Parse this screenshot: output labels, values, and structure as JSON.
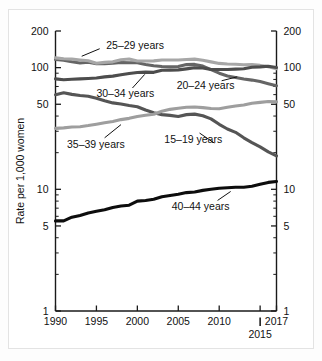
{
  "chart_data": {
    "type": "line",
    "title": "",
    "xlabel": "",
    "ylabel": "Rate per 1,000 women",
    "yscale": "log",
    "ylim": [
      1,
      200
    ],
    "xlim": [
      1990,
      2017
    ],
    "grid": false,
    "legend_position": "inline-labels",
    "y_ticks_major": [
      1,
      5,
      10,
      50,
      100,
      200
    ],
    "y_tick_labels": [
      "1",
      "5",
      "10",
      "50",
      "100",
      "200"
    ],
    "y_ticks_minor": [
      2,
      3,
      4,
      6,
      7,
      8,
      9,
      20,
      30,
      40,
      60,
      70,
      80,
      90
    ],
    "x_ticks": [
      1990,
      1995,
      2000,
      2005,
      2010,
      2017
    ],
    "x_tick_labels": [
      "1990",
      "1995",
      "2000",
      "2005",
      "2010",
      "2017"
    ],
    "x_tick_extra": {
      "value": 2015,
      "label": "2015"
    },
    "x": [
      1990,
      1991,
      1992,
      1993,
      1994,
      1995,
      1996,
      1997,
      1998,
      1999,
      2000,
      2001,
      2002,
      2003,
      2004,
      2005,
      2006,
      2007,
      2008,
      2009,
      2010,
      2011,
      2012,
      2013,
      2014,
      2015,
      2016,
      2017
    ],
    "series": [
      {
        "name": "15–19 years",
        "color": "#555555",
        "label_x": 2003.3,
        "label_y": 26.0,
        "leader": [
          [
            2007.6,
            29.0
          ],
          [
            2009.4,
            24.0
          ]
        ],
        "values": [
          59.9,
          62.1,
          60.3,
          59.0,
          58.2,
          56.0,
          53.5,
          51.3,
          50.3,
          48.8,
          47.7,
          44.8,
          42.6,
          41.1,
          40.5,
          39.7,
          41.1,
          41.5,
          40.2,
          37.9,
          34.2,
          31.3,
          29.4,
          26.5,
          24.2,
          22.3,
          20.3,
          18.8
        ]
      },
      {
        "name": "20–24 years",
        "color": "#656565",
        "label_x": 2004.8,
        "label_y": 72.0,
        "leader": [
          [
            2010.3,
            78.0
          ],
          [
            2012.2,
            84.0
          ]
        ],
        "values": [
          116.5,
          115.3,
          111.6,
          109.2,
          110.6,
          107.5,
          107.8,
          108.9,
          110.2,
          109.7,
          109.7,
          106.2,
          103.6,
          102.1,
          101.7,
          102.2,
          105.9,
          106.3,
          103.0,
          96.3,
          90.0,
          85.3,
          83.1,
          80.7,
          79.0,
          76.8,
          73.8,
          71.0
        ]
      },
      {
        "name": "25–29 years",
        "color": "#a7a7a7",
        "label_x": 1996.2,
        "label_y": 152.0,
        "leader": [
          [
            1995.4,
            143.0
          ],
          [
            1993.2,
            124.0
          ]
        ],
        "values": [
          120.2,
          118.2,
          117.4,
          115.5,
          113.9,
          108.8,
          110.4,
          111.6,
          115.9,
          117.8,
          113.5,
          113.4,
          113.6,
          115.6,
          115.5,
          115.5,
          116.7,
          117.5,
          115.1,
          111.5,
          108.3,
          107.2,
          106.5,
          105.5,
          105.8,
          104.3,
          101.9,
          98.0
        ]
      },
      {
        "name": "30–34 years",
        "color": "#4d4d4d",
        "label_x": 1995.0,
        "label_y": 62.0,
        "leader": [
          [
            1999.4,
            68.0
          ],
          [
            2000.9,
            88.0
          ]
        ],
        "values": [
          80.8,
          79.5,
          80.2,
          80.8,
          81.5,
          82.1,
          83.9,
          85.2,
          87.4,
          89.6,
          91.2,
          91.9,
          91.5,
          95.1,
          95.3,
          95.8,
          97.7,
          99.9,
          99.3,
          96.5,
          96.5,
          96.5,
          97.3,
          98.0,
          100.8,
          101.5,
          102.6,
          100.3
        ]
      },
      {
        "name": "35–39 years",
        "color": "#9e9e9e",
        "label_x": 1991.4,
        "label_y": 23.5,
        "leader": [
          [
            1996.0,
            26.5
          ],
          [
            1998.0,
            34.0
          ]
        ],
        "values": [
          31.7,
          32.0,
          32.5,
          32.7,
          33.4,
          34.3,
          35.3,
          36.1,
          37.4,
          38.3,
          39.7,
          40.6,
          41.4,
          43.8,
          45.4,
          46.3,
          47.3,
          47.5,
          46.9,
          46.1,
          45.9,
          47.2,
          48.3,
          49.3,
          51.0,
          51.8,
          52.7,
          52.3
        ]
      },
      {
        "name": "40–44 years",
        "color": "#0d0d0d",
        "label_x": 2004.2,
        "label_y": 7.2,
        "leader": [
          [
            2009.8,
            8.1
          ],
          [
            2011.4,
            9.6
          ]
        ],
        "values": [
          5.5,
          5.5,
          5.9,
          6.1,
          6.4,
          6.6,
          6.8,
          7.1,
          7.3,
          7.4,
          8.0,
          8.1,
          8.3,
          8.7,
          8.9,
          9.1,
          9.4,
          9.5,
          9.8,
          10.0,
          10.2,
          10.3,
          10.4,
          10.4,
          10.6,
          11.0,
          11.4,
          11.6
        ]
      }
    ]
  }
}
